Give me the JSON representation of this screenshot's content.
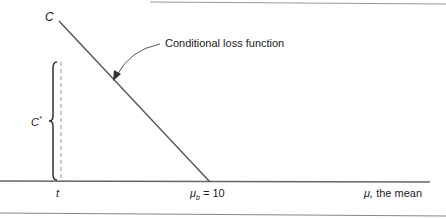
{
  "diagram": {
    "labels": {
      "y_top": "C",
      "c_star": "C",
      "c_star_sup": "*",
      "annotation": "Conditional loss function",
      "t": "t",
      "mu_b_sym": "μ",
      "mu_b_sub": "b",
      "mu_b_value": " = 10",
      "x_axis_sym": "μ,",
      "x_axis_text": " the mean"
    },
    "colors": {
      "line": "#555555",
      "axis": "#666666",
      "dashed": "#999999",
      "brace": "#333333",
      "border": "#888888"
    }
  }
}
